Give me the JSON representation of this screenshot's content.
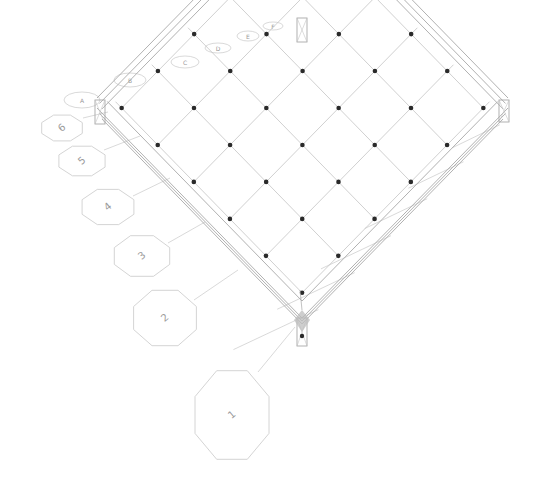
{
  "diagram": {
    "title": "Structural grid frame (3D view)",
    "colors": {
      "background": "#ffffff",
      "frame_line": "#a8a8a8",
      "grid_line": "#c4c4c4",
      "bubble_line": "#cfcfcf",
      "node": "#2a2a2a",
      "selection": "#bdbdbd"
    },
    "corners": {
      "front": [
        302,
        318
      ],
      "left": [
        97,
        108
      ],
      "back": [
        302,
        28
      ],
      "right": [
        508,
        108
      ]
    },
    "grid": {
      "rows": 6,
      "cols": 6
    },
    "grid_bubbles_left_axis": [
      "1",
      "2",
      "3",
      "4",
      "5",
      "6"
    ],
    "grid_bubbles_back_axis": [
      "A",
      "B",
      "C",
      "D",
      "E",
      "F"
    ],
    "selected_node": {
      "label": "corner support",
      "position": [
        302,
        318
      ]
    }
  }
}
